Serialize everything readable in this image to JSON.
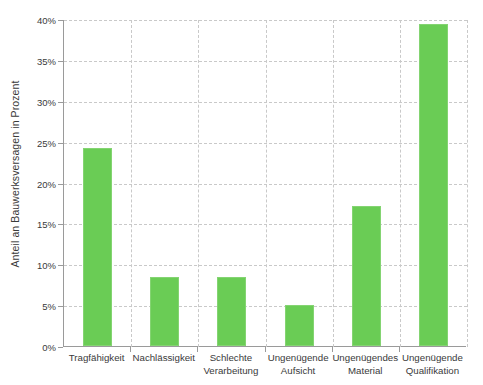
{
  "chart_data": {
    "type": "bar",
    "title": "",
    "subtitle": "",
    "xlabel": "",
    "ylabel": "Anteil an Bauwerksversagen in Prozent",
    "categories": [
      "Tragfähigkeit",
      "Nachlässigkeit",
      "Schlechte Verarbeitung",
      "Ungenügende Aufsicht",
      "Ungenügendes Material",
      "Ungenügende Qualifikation"
    ],
    "category_lines": [
      [
        "Tragfähigkeit"
      ],
      [
        "Nachlässigkeit"
      ],
      [
        "Schlechte",
        "Verarbeitung"
      ],
      [
        "Ungenügende",
        "Aufsicht"
      ],
      [
        "Ungenügendes",
        "Material"
      ],
      [
        "Ungenügende",
        "Qualifikation"
      ]
    ],
    "values": [
      24.2,
      8.4,
      8.4,
      5.0,
      17.1,
      39.4
    ],
    "value_unit": "%",
    "ylim": [
      0,
      40
    ],
    "ytick_values": [
      0,
      5,
      10,
      15,
      20,
      25,
      30,
      35,
      40
    ],
    "ytick_labels": [
      "0%",
      "5%",
      "10%",
      "15%",
      "20%",
      "25%",
      "30%",
      "35%",
      "40%"
    ],
    "grid": {
      "horizontal": true,
      "vertical": true,
      "style": "dashed",
      "color": "#c9c9c9"
    },
    "legend": {
      "visible": false,
      "position": "none"
    },
    "series": [
      {
        "name": "Anteil an Bauwerksversagen",
        "color": "#6ACC55",
        "values": [
          24.2,
          8.4,
          8.4,
          5.0,
          17.1,
          39.4
        ]
      }
    ],
    "colors": {
      "bar": "#6ACC55",
      "bar_edge": "#84d472",
      "axis": "#9a9a9a",
      "grid": "#c9c9c9",
      "text": "#3a3a3a",
      "background": "#ffffff"
    }
  }
}
